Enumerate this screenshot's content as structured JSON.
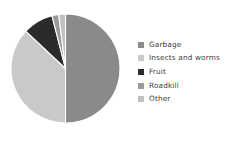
{
  "chart_data": {
    "type": "pie",
    "title": "",
    "categories": [
      "Garbage",
      "Insects and worms",
      "Fruit",
      "Roadkill",
      "Other"
    ],
    "values": [
      50,
      37,
      9,
      2,
      2
    ],
    "unit": "percent",
    "colors": [
      "#8a8a8a",
      "#c9c9c9",
      "#2b2b2b",
      "#9a9a9a",
      "#c0c0c0"
    ],
    "start_angle_deg": 0,
    "direction": "clockwise",
    "wedge_edge_color": "#ffffff",
    "labels_shown": false,
    "grid": false,
    "legend_position": "right",
    "slices": [
      {
        "label": "Garbage",
        "value": 50,
        "color": "#8a8a8a"
      },
      {
        "label": "Insects and worms",
        "value": 37,
        "color": "#c9c9c9"
      },
      {
        "label": "Fruit",
        "value": 9,
        "color": "#2b2b2b"
      },
      {
        "label": "Roadkill",
        "value": 2,
        "color": "#9a9a9a"
      },
      {
        "label": "Other",
        "value": 2,
        "color": "#c0c0c0"
      }
    ]
  },
  "legend": {
    "items": [
      {
        "label": "Garbage",
        "color": "#8a8a8a"
      },
      {
        "label": "Insects and worms",
        "color": "#c9c9c9"
      },
      {
        "label": "Fruit",
        "color": "#2b2b2b"
      },
      {
        "label": "Roadkill",
        "color": "#9a9a9a"
      },
      {
        "label": "Other",
        "color": "#c0c0c0"
      }
    ]
  },
  "canvas": {
    "background": "#ffffff"
  }
}
